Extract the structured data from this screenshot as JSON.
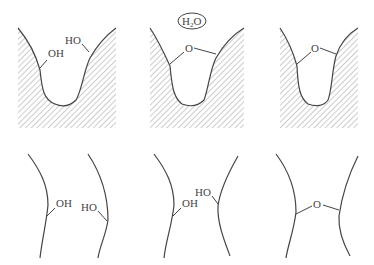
{
  "diagram": {
    "top_row": [
      {
        "id": "panel-1",
        "labels": {
          "left": "OH",
          "right": "HO"
        }
      },
      {
        "id": "panel-2",
        "labels": {
          "bridge": "O",
          "released": "H2O"
        }
      },
      {
        "id": "panel-3",
        "labels": {
          "bridge": "O"
        }
      }
    ],
    "bottom_row": [
      {
        "id": "panel-4",
        "labels": {
          "left": "OH",
          "right": "HO"
        }
      },
      {
        "id": "panel-5",
        "labels": {
          "left": "OH",
          "right": "HO"
        }
      },
      {
        "id": "panel-6",
        "labels": {
          "bridge": "O"
        }
      }
    ],
    "water_bubble": {
      "text_main": "H",
      "text_sub": "2",
      "text_end": "O"
    },
    "colors": {
      "line": "#444444",
      "hatch": "#888888",
      "background": "#ffffff"
    }
  }
}
